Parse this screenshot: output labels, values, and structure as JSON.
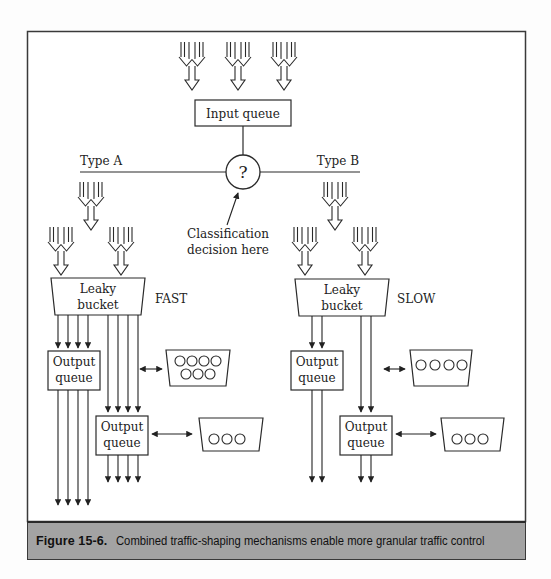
{
  "figure": {
    "number": "Figure 15-6.",
    "caption": "Combined traffic-shaping mechanisms enable more granular traffic control"
  },
  "diagram": {
    "input_queue": "Input queue",
    "classifier_symbol": "?",
    "classification_note_line1": "Classification",
    "classification_note_line2": "decision here",
    "branch_a": {
      "label": "Type A",
      "bucket_line1": "Leaky",
      "bucket_line2": "bucket",
      "speed": "FAST",
      "output_queue_1_line1": "Output",
      "output_queue_1_line2": "queue",
      "output_queue_2_line1": "Output",
      "output_queue_2_line2": "queue",
      "buffer_1_slots": 7,
      "buffer_2_slots": 3
    },
    "branch_b": {
      "label": "Type B",
      "bucket_line1": "Leaky",
      "bucket_line2": "bucket",
      "speed": "SLOW",
      "output_queue_1_line1": "Output",
      "output_queue_1_line2": "queue",
      "output_queue_2_line1": "Output",
      "output_queue_2_line2": "queue",
      "buffer_1_slots": 4,
      "buffer_2_slots": 3
    }
  },
  "colors": {
    "line": "#2a2a2a",
    "caption_bg": "#a3a3a3"
  }
}
